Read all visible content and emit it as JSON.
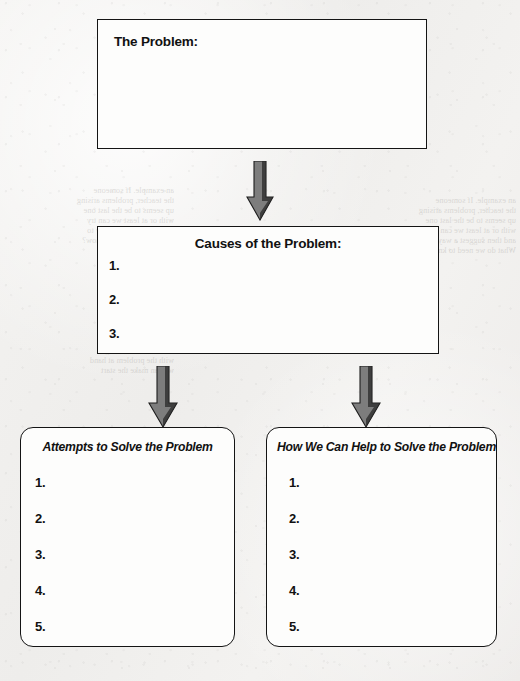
{
  "document": {
    "type": "graphic-organizer-worksheet",
    "background_color": "#f1f0ee",
    "ink_color": "#141414",
    "shadow_color": "#494949",
    "arrow_color": "#7d7d7d"
  },
  "boxes": {
    "problem": {
      "title": "The Problem:",
      "title_align": "left",
      "items": []
    },
    "causes": {
      "title": "Causes of the Problem:",
      "title_align": "center",
      "items": [
        "1.",
        "2.",
        "3."
      ]
    },
    "attempts": {
      "title": "Attempts to Solve the Problem",
      "title_align": "center",
      "items": [
        "1.",
        "2.",
        "3.",
        "4.",
        "5."
      ]
    },
    "help": {
      "title": "How We Can Help to Solve the Problem",
      "title_align": "left",
      "items": [
        "1.",
        "2.",
        "3.",
        "4.",
        "5."
      ]
    }
  },
  "arrows": [
    {
      "name": "problem-to-causes",
      "direction": "down"
    },
    {
      "name": "causes-to-attempts",
      "direction": "down"
    },
    {
      "name": "causes-to-help",
      "direction": "down"
    }
  ],
  "bleed_through": {
    "left_paragraph": "an example. If someone\nthe teacher, problems arising\nup seems to be the last one\nwith or at least we can try\nand then suggest a way to\nWhat do we need to know?",
    "left_paragraph_2": "to find out\nand then we can begin\nwith the problem at hand\nwe can make the start",
    "heading": "Developing the\nMaterials",
    "subheading": "Lesson 1:  Working on a Problem",
    "sub_body": "the class is encouraged to report on\nhow the problem can be solved"
  }
}
